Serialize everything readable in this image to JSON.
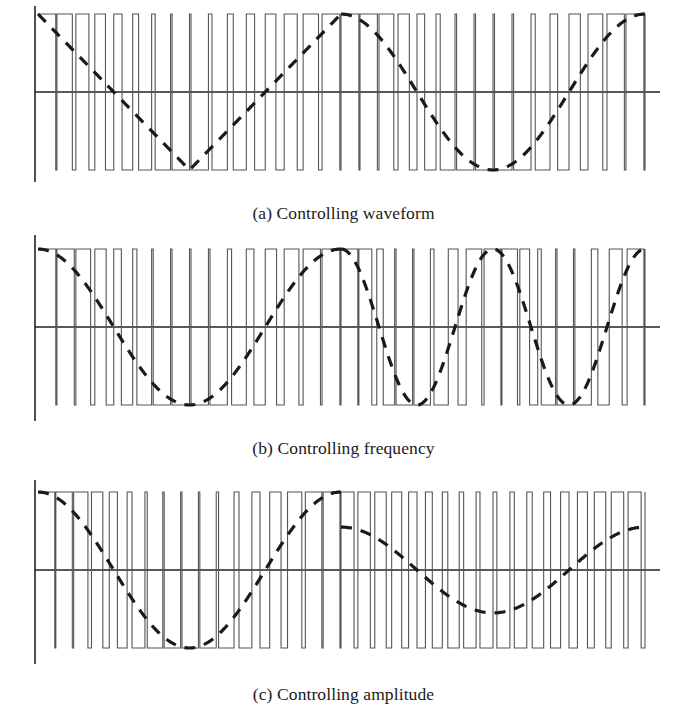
{
  "figure": {
    "name": "pwm-modulation-figure",
    "background_color": "#ffffff",
    "pulse_stroke_color": "#555555",
    "axis_stroke_color": "#222222",
    "modulating_stroke_color": "#1a1a1a",
    "pulse_stroke_width": 1.1,
    "axis_stroke_width": 1.6,
    "modulating_stroke_width": 3.2,
    "modulating_dash": "11 9"
  },
  "panels": [
    {
      "id": "a",
      "caption": "(a) Controlling waveform",
      "geometry": {
        "x_axis_start": 35,
        "x_axis_end": 660,
        "wave_start": 38,
        "wave_end": 645,
        "y_top": 14,
        "y_zero": 92,
        "y_bottom": 170,
        "axis_top": 6,
        "axis_bottom": 182
      },
      "halves": [
        {
          "name": "triangle-half",
          "x_start": 38,
          "x_end": 341,
          "modulating_type": "triangle",
          "cycles": 1,
          "amplitude": 1.0,
          "phase_deg": 90,
          "carrier_pulses": 16
        },
        {
          "name": "sine-half",
          "x_start": 341,
          "x_end": 645,
          "modulating_type": "sine",
          "cycles": 1,
          "amplitude": 1.0,
          "phase_deg": 90,
          "carrier_pulses": 16
        }
      ]
    },
    {
      "id": "b",
      "caption": "(b) Controlling frequency",
      "geometry": {
        "x_axis_start": 35,
        "x_axis_end": 660,
        "wave_start": 38,
        "wave_end": 645,
        "y_top": 14,
        "y_zero": 92,
        "y_bottom": 170,
        "axis_top": 0,
        "axis_bottom": 186
      },
      "halves": [
        {
          "name": "low-frequency-half",
          "x_start": 38,
          "x_end": 341,
          "modulating_type": "sine",
          "cycles": 1,
          "amplitude": 1.0,
          "phase_deg": 90,
          "carrier_pulses": 16
        },
        {
          "name": "high-frequency-half",
          "x_start": 341,
          "x_end": 645,
          "modulating_type": "sine",
          "cycles": 2,
          "amplitude": 1.0,
          "phase_deg": 90,
          "carrier_pulses": 17
        }
      ]
    },
    {
      "id": "c",
      "caption": "(c) Controlling amplitude",
      "geometry": {
        "x_axis_start": 35,
        "x_axis_end": 660,
        "wave_start": 38,
        "wave_end": 645,
        "y_top": 14,
        "y_zero": 92,
        "y_bottom": 170,
        "axis_top": 2,
        "axis_bottom": 186
      },
      "halves": [
        {
          "name": "full-amplitude-half",
          "x_start": 38,
          "x_end": 341,
          "modulating_type": "sine",
          "cycles": 1,
          "amplitude": 1.0,
          "phase_deg": 90,
          "carrier_pulses": 17
        },
        {
          "name": "reduced-amplitude-half",
          "x_start": 341,
          "x_end": 645,
          "modulating_type": "sine",
          "cycles": 1,
          "amplitude": 0.55,
          "phase_deg": 90,
          "carrier_pulses": 18
        }
      ]
    }
  ],
  "chart_data": {
    "type": "line",
    "xlabel": "",
    "ylabel": "",
    "grid": false,
    "legend": "none",
    "ylim": [
      -1,
      1
    ],
    "panels": [
      {
        "label": "(a) Controlling waveform",
        "left_half": {
          "modulating_shape": "triangle",
          "cycles": 1,
          "amplitude": 1.0,
          "carrier_pulses": 16
        },
        "right_half": {
          "modulating_shape": "sine",
          "cycles": 1,
          "amplitude": 1.0,
          "carrier_pulses": 16
        }
      },
      {
        "label": "(b) Controlling frequency",
        "left_half": {
          "modulating_shape": "sine",
          "cycles": 1,
          "amplitude": 1.0,
          "carrier_pulses": 16
        },
        "right_half": {
          "modulating_shape": "sine",
          "cycles": 2,
          "amplitude": 1.0,
          "carrier_pulses": 17
        }
      },
      {
        "label": "(c) Controlling amplitude",
        "left_half": {
          "modulating_shape": "sine",
          "cycles": 1,
          "amplitude": 1.0,
          "carrier_pulses": 17
        },
        "right_half": {
          "modulating_shape": "sine",
          "cycles": 1,
          "amplitude": 0.55,
          "carrier_pulses": 18
        }
      }
    ]
  }
}
